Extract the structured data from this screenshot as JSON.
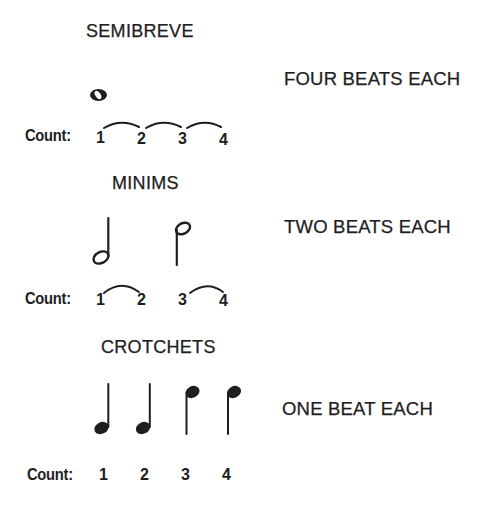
{
  "sections": [
    {
      "heading": "SEMIBREVE",
      "description": "FOUR BEATS EACH",
      "note_type": "semibreve",
      "count_label": "Count:",
      "counts": [
        "1",
        "2",
        "3",
        "4"
      ],
      "ties": [
        [
          "1",
          "2"
        ],
        [
          "2",
          "3"
        ],
        [
          "3",
          "4"
        ]
      ]
    },
    {
      "heading": "MINIMS",
      "description": "TWO BEATS EACH",
      "note_type": "minim",
      "count_label": "Count:",
      "counts": [
        "1",
        "2",
        "3",
        "4"
      ],
      "ties": [
        [
          "1",
          "2"
        ],
        [
          "3",
          "4"
        ]
      ]
    },
    {
      "heading": "CROTCHETS",
      "description": "ONE BEAT EACH",
      "note_type": "crotchet",
      "count_label": "Count:",
      "counts": [
        "1",
        "2",
        "3",
        "4"
      ],
      "ties": []
    }
  ],
  "colors": {
    "ink": "#1e1e1e",
    "background": "#ffffff"
  }
}
